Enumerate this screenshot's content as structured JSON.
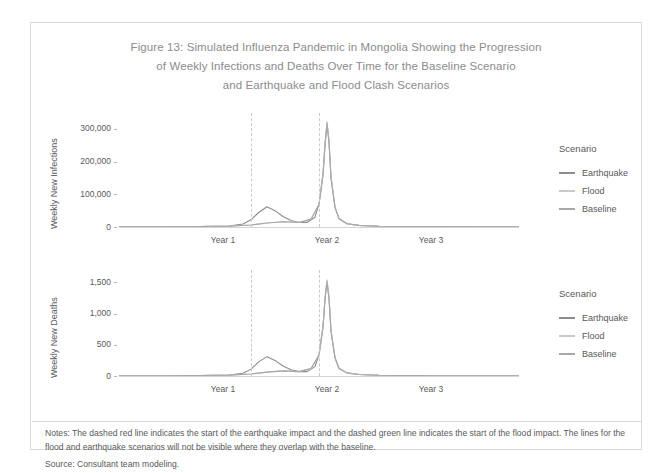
{
  "figure": {
    "title_lines": [
      "Figure 13: Simulated Influenza Pandemic in Mongolia Showing the Progression",
      "of Weekly Infections and Deaths Over Time for the Baseline Scenario",
      "and Earthquake and Flood Clash Scenarios"
    ],
    "notes": "Notes: The dashed red line indicates the start of the earthquake impact and the dashed green line indicates the start of the flood impact. The lines for the flood and earthquake scenarios will not be visible where they overlap with the baseline.",
    "source": "Source: Consultant team modeling."
  },
  "legend": {
    "title": "Scenario",
    "items": [
      {
        "label": "Earthquake",
        "color": "#8c8c8c"
      },
      {
        "label": "Flood",
        "color": "#c9c9c9"
      },
      {
        "label": "Baseline",
        "color": "#a8a8a8"
      }
    ]
  },
  "chart_data": [
    {
      "type": "line",
      "title": "Weekly New Infections",
      "xlabel": "",
      "ylabel": "Weekly New Infections",
      "x_tick_labels": [
        "Year 1",
        "Year 2",
        "Year 3"
      ],
      "x_tick_values": [
        52,
        104,
        156
      ],
      "xlim": [
        0,
        200
      ],
      "ylim": [
        0,
        330000
      ],
      "y_tick_labels": [
        "0",
        "100,000",
        "200,000",
        "300,000"
      ],
      "y_tick_values": [
        0,
        100000,
        200000,
        300000
      ],
      "grid": false,
      "annotations": [
        {
          "name": "earthquake-start",
          "x": 66,
          "style": "dashed",
          "color": "#c9c9c7"
        },
        {
          "name": "flood-start",
          "x": 100,
          "style": "dashed",
          "color": "#c9c9c7"
        }
      ],
      "series": [
        {
          "name": "Earthquake",
          "color": "#8c8c8c",
          "points": [
            [
              0,
              500
            ],
            [
              20,
              900
            ],
            [
              40,
              1600
            ],
            [
              55,
              3000
            ],
            [
              62,
              9000
            ],
            [
              66,
              22000
            ],
            [
              70,
              45000
            ],
            [
              74,
              62000
            ],
            [
              78,
              50000
            ],
            [
              82,
              32000
            ],
            [
              86,
              20000
            ],
            [
              90,
              14000
            ],
            [
              94,
              14000
            ],
            [
              98,
              30000
            ],
            [
              100,
              70000
            ],
            [
              102,
              160000
            ],
            [
              103,
              250000
            ],
            [
              104,
              318000
            ],
            [
              105,
              260000
            ],
            [
              106,
              150000
            ],
            [
              108,
              60000
            ],
            [
              110,
              25000
            ],
            [
              114,
              10000
            ],
            [
              120,
              5000
            ],
            [
              130,
              2500
            ],
            [
              145,
              1500
            ],
            [
              160,
              1000
            ],
            [
              180,
              700
            ],
            [
              200,
              500
            ]
          ]
        },
        {
          "name": "Flood",
          "color": "#c9c9c9",
          "points": [
            [
              0,
              400
            ],
            [
              20,
              800
            ],
            [
              40,
              1500
            ],
            [
              55,
              2600
            ],
            [
              66,
              6000
            ],
            [
              74,
              12000
            ],
            [
              82,
              16000
            ],
            [
              90,
              14000
            ],
            [
              96,
              24000
            ],
            [
              100,
              70000
            ],
            [
              102,
              165000
            ],
            [
              103,
              255000
            ],
            [
              104,
              322000
            ],
            [
              105,
              265000
            ],
            [
              106,
              155000
            ],
            [
              108,
              62000
            ],
            [
              110,
              26000
            ],
            [
              114,
              10000
            ],
            [
              120,
              5000
            ],
            [
              130,
              2500
            ],
            [
              145,
              1500
            ],
            [
              160,
              1000
            ],
            [
              180,
              700
            ],
            [
              200,
              500
            ]
          ]
        },
        {
          "name": "Baseline",
          "color": "#a8a8a8",
          "points": [
            [
              0,
              400
            ],
            [
              20,
              800
            ],
            [
              40,
              1500
            ],
            [
              55,
              2600
            ],
            [
              66,
              6000
            ],
            [
              74,
              12000
            ],
            [
              82,
              16000
            ],
            [
              90,
              14000
            ],
            [
              96,
              24000
            ],
            [
              100,
              68000
            ],
            [
              102,
              160000
            ],
            [
              103,
              250000
            ],
            [
              104,
              315000
            ],
            [
              105,
              258000
            ],
            [
              106,
              150000
            ],
            [
              108,
              60000
            ],
            [
              110,
              25000
            ],
            [
              114,
              10000
            ],
            [
              120,
              5000
            ],
            [
              130,
              2500
            ],
            [
              145,
              1500
            ],
            [
              160,
              1000
            ],
            [
              180,
              700
            ],
            [
              200,
              500
            ]
          ]
        }
      ]
    },
    {
      "type": "line",
      "title": "Weekly New Deaths",
      "xlabel": "",
      "ylabel": "Weekly New Deaths",
      "x_tick_labels": [
        "Year 1",
        "Year 2",
        "Year 3"
      ],
      "x_tick_values": [
        52,
        104,
        156
      ],
      "xlim": [
        0,
        200
      ],
      "ylim": [
        0,
        1600
      ],
      "y_tick_labels": [
        "0",
        "500",
        "1,000",
        "1,500"
      ],
      "y_tick_values": [
        0,
        500,
        1000,
        1500
      ],
      "grid": false,
      "annotations": [
        {
          "name": "earthquake-start",
          "x": 66,
          "style": "dashed",
          "color": "#c9c9c7"
        },
        {
          "name": "flood-start",
          "x": 100,
          "style": "dashed",
          "color": "#c9c9c7"
        }
      ],
      "series": [
        {
          "name": "Earthquake",
          "color": "#8c8c8c",
          "points": [
            [
              0,
              3
            ],
            [
              20,
              5
            ],
            [
              40,
              9
            ],
            [
              55,
              16
            ],
            [
              62,
              45
            ],
            [
              66,
              110
            ],
            [
              70,
              230
            ],
            [
              74,
              310
            ],
            [
              78,
              250
            ],
            [
              82,
              160
            ],
            [
              86,
              100
            ],
            [
              90,
              70
            ],
            [
              94,
              70
            ],
            [
              98,
              150
            ],
            [
              100,
              340
            ],
            [
              102,
              790
            ],
            [
              103,
              1230
            ],
            [
              104,
              1520
            ],
            [
              105,
              1250
            ],
            [
              106,
              720
            ],
            [
              108,
              290
            ],
            [
              110,
              120
            ],
            [
              114,
              50
            ],
            [
              120,
              25
            ],
            [
              130,
              13
            ],
            [
              145,
              8
            ],
            [
              160,
              5
            ],
            [
              180,
              4
            ],
            [
              200,
              3
            ]
          ]
        },
        {
          "name": "Flood",
          "color": "#c9c9c9",
          "points": [
            [
              0,
              2
            ],
            [
              20,
              4
            ],
            [
              40,
              8
            ],
            [
              55,
              14
            ],
            [
              66,
              32
            ],
            [
              74,
              62
            ],
            [
              82,
              82
            ],
            [
              90,
              70
            ],
            [
              96,
              120
            ],
            [
              100,
              340
            ],
            [
              102,
              800
            ],
            [
              103,
              1240
            ],
            [
              104,
              1540
            ],
            [
              105,
              1270
            ],
            [
              106,
              740
            ],
            [
              108,
              300
            ],
            [
              110,
              125
            ],
            [
              114,
              50
            ],
            [
              120,
              25
            ],
            [
              130,
              13
            ],
            [
              145,
              8
            ],
            [
              160,
              5
            ],
            [
              180,
              4
            ],
            [
              200,
              3
            ]
          ]
        },
        {
          "name": "Baseline",
          "color": "#a8a8a8",
          "points": [
            [
              0,
              2
            ],
            [
              20,
              4
            ],
            [
              40,
              8
            ],
            [
              55,
              14
            ],
            [
              66,
              32
            ],
            [
              74,
              62
            ],
            [
              82,
              82
            ],
            [
              90,
              70
            ],
            [
              96,
              118
            ],
            [
              100,
              330
            ],
            [
              102,
              780
            ],
            [
              103,
              1220
            ],
            [
              104,
              1505
            ],
            [
              105,
              1240
            ],
            [
              106,
              715
            ],
            [
              108,
              290
            ],
            [
              110,
              120
            ],
            [
              114,
              48
            ],
            [
              120,
              24
            ],
            [
              130,
              12
            ],
            [
              145,
              8
            ],
            [
              160,
              5
            ],
            [
              180,
              4
            ],
            [
              200,
              3
            ]
          ]
        }
      ]
    }
  ]
}
